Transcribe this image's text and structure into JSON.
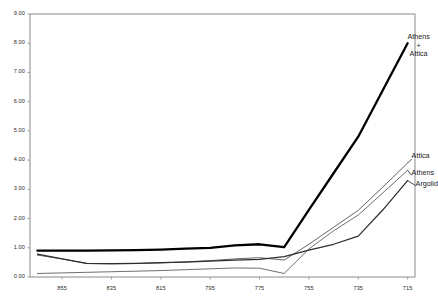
{
  "chart_data": {
    "type": "line",
    "title": "",
    "subtitle": "",
    "xlabel": "",
    "ylabel": "",
    "grid": false,
    "legend_position": "inline-right-annotations",
    "x": [
      865,
      855,
      845,
      835,
      825,
      815,
      805,
      795,
      785,
      775,
      765,
      755,
      745,
      735,
      725,
      715
    ],
    "x_tick_labels": [
      "855",
      "835",
      "815",
      "795",
      "775",
      "755",
      "735",
      "715"
    ],
    "x_ticks": [
      855,
      835,
      815,
      795,
      775,
      755,
      735,
      715
    ],
    "xlim": [
      868,
      712
    ],
    "x_axis_direction": "descending",
    "y_tick_labels": [
      "0.00",
      "1.00",
      "2.00",
      "3.00",
      "4.00",
      "5.00",
      "6.00",
      "7.00",
      "8.00",
      "9.00"
    ],
    "y_ticks": [
      0,
      1,
      2,
      3,
      4,
      5,
      6,
      7,
      8,
      9
    ],
    "ylim": [
      0,
      9
    ],
    "series": [
      {
        "name": "Athens + Attica",
        "label_lines": [
          "Athens",
          "+",
          "Attica"
        ],
        "color": "#000000",
        "width": 2.3,
        "values": [
          0.9,
          0.9,
          0.9,
          0.91,
          0.92,
          0.94,
          0.97,
          1.0,
          1.08,
          1.12,
          1.02,
          2.3,
          3.55,
          4.8,
          6.4,
          8.0
        ]
      },
      {
        "name": "Attica",
        "label_lines": [
          "Attica"
        ],
        "color": "#3c3c3c",
        "width": 0.8,
        "values": [
          0.75,
          0.62,
          0.46,
          0.45,
          0.46,
          0.48,
          0.52,
          0.56,
          0.62,
          0.66,
          0.58,
          1.12,
          1.7,
          2.28,
          3.08,
          3.9
        ]
      },
      {
        "name": "Athens",
        "label_lines": [
          "Athens"
        ],
        "color": "#4a4a4a",
        "width": 0.8,
        "values": [
          0.12,
          0.14,
          0.16,
          0.18,
          0.2,
          0.22,
          0.25,
          0.28,
          0.31,
          0.3,
          0.12,
          0.96,
          1.58,
          2.12,
          2.88,
          3.65
        ]
      },
      {
        "name": "Argolid",
        "label_lines": [
          "Argolid"
        ],
        "color": "#2e2e2e",
        "width": 1.25,
        "values": [
          0.78,
          0.62,
          0.47,
          0.46,
          0.47,
          0.49,
          0.51,
          0.54,
          0.58,
          0.6,
          0.7,
          0.92,
          1.12,
          1.4,
          2.3,
          3.3
        ]
      }
    ],
    "annotations": [
      {
        "text": "Athens + Attica",
        "at_x": 715,
        "at_y": 8.0
      },
      {
        "text": "Attica",
        "at_x": 715,
        "at_y": 3.9
      },
      {
        "text": "Athens",
        "at_x": 715,
        "at_y": 3.65
      },
      {
        "text": "Argolid",
        "at_x": 715,
        "at_y": 3.3
      }
    ]
  },
  "axis": {
    "frame_color": "#8a8a8a",
    "tick_color": "#8a8a8a"
  },
  "labels": {
    "athens_attica_line1": "Athens",
    "athens_attica_line2": "+",
    "athens_attica_line3": "Attica",
    "attica": "Attica",
    "athens": "Athens",
    "argolid": "Argolid"
  }
}
